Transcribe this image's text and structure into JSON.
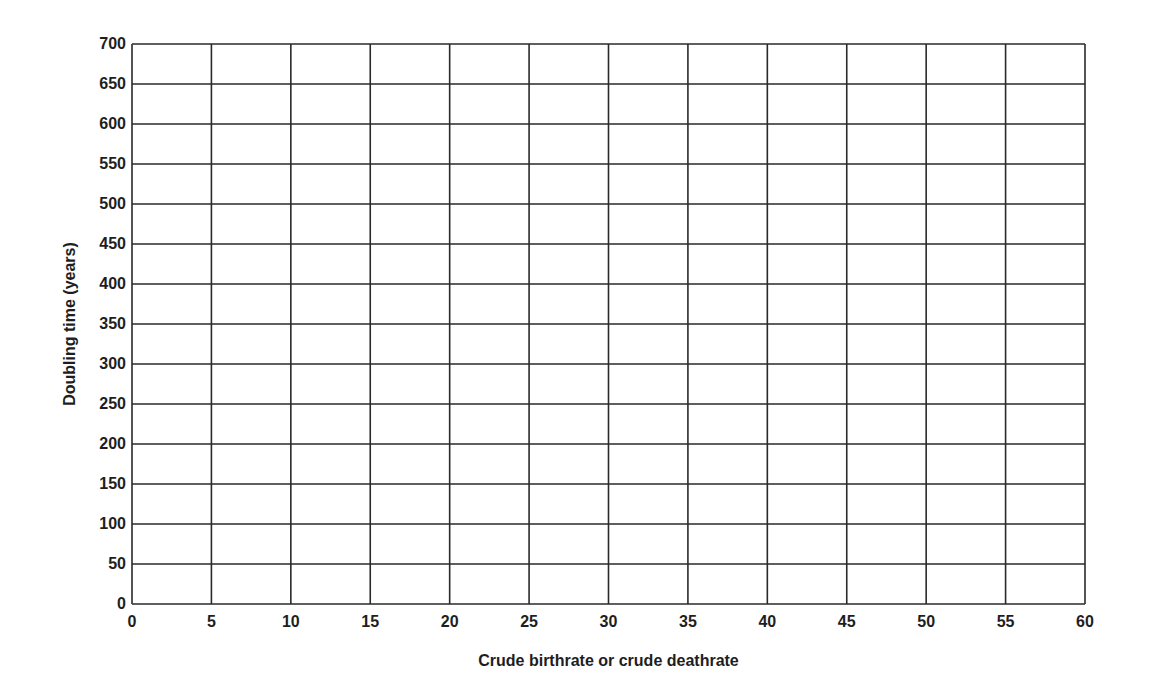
{
  "chart_data": {
    "type": "line",
    "title": "",
    "xlabel": "Crude birthrate or crude deathrate",
    "ylabel": "Doubling time (years)",
    "xlim": [
      0,
      60
    ],
    "ylim": [
      0,
      700
    ],
    "xticks": [
      0,
      5,
      10,
      15,
      20,
      25,
      30,
      35,
      40,
      45,
      50,
      55,
      60
    ],
    "yticks": [
      0,
      50,
      100,
      150,
      200,
      250,
      300,
      350,
      400,
      450,
      500,
      550,
      600,
      650,
      700
    ],
    "grid": true,
    "series": [],
    "legend": null,
    "note": "Blank grid worksheet; no data plotted"
  },
  "colors": {
    "grid": "#2a2a2a",
    "text": "#1e1e1e",
    "background": "#ffffff"
  }
}
